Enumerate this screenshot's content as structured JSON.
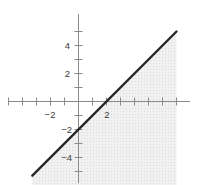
{
  "chart_data": {
    "type": "line",
    "title": "",
    "xlabel": "",
    "ylabel": "",
    "xlim": [
      -5.0,
      8.0
    ],
    "ylim": [
      -6.0,
      6.2
    ],
    "grid": false,
    "legend": null,
    "unit_px": 14,
    "origin_px": {
      "x": 78,
      "y": 101
    },
    "axes": {
      "x_axis": {
        "y_value": 0,
        "x_start": -5.0,
        "x_end": 8.0
      },
      "y_axis": {
        "x_value": 0,
        "y_start": 6.2,
        "y_end": -5.85
      },
      "tick_interval": 1,
      "tick_length_px": 8,
      "x_ticks": [
        -5,
        -4,
        -3,
        -2,
        -1,
        1,
        2,
        3,
        4,
        5,
        6,
        7
      ],
      "y_ticks": [
        5,
        4,
        3,
        2,
        1,
        -1,
        -2,
        -3,
        -4,
        -5
      ],
      "x_tick_labels": [
        {
          "value": -2,
          "text": "−2"
        },
        {
          "value": 2,
          "text": "2"
        }
      ],
      "y_tick_labels": [
        {
          "value": 4,
          "text": "4"
        },
        {
          "value": 2,
          "text": "2"
        },
        {
          "value": -2,
          "text": "−2"
        },
        {
          "value": -4,
          "text": "−4"
        }
      ]
    },
    "series": [
      {
        "name": "y = x - 2",
        "type": "line",
        "equation": "y = x - 2",
        "slope": 1,
        "intercept": -2,
        "style": "solid",
        "x_intercept": 2,
        "y_intercept": -2,
        "points": [
          {
            "x": -3.3,
            "y": -5.3
          },
          {
            "x": 7.0,
            "y": 5.0
          }
        ]
      }
    ],
    "shaded_region": {
      "label": "y ≤ x − 2",
      "description": "region below and to the right of the line",
      "boundary_included": true,
      "x_from": -3.3,
      "x_to": 7.0
    },
    "colors": {
      "background": "#ffffff",
      "line": "#262626",
      "axis": "#8a8a8a",
      "tick": "#8a8a8a",
      "label": "#3b3b3b",
      "shade_fill": "#efefef",
      "shade_dot": "#dcdcdc"
    }
  }
}
